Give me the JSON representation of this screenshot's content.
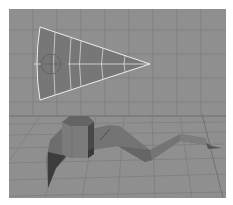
{
  "viewport": {
    "label": "3D perspective viewport",
    "background": "#8f8f8f",
    "grid_color": "#7d7d7d",
    "horizon_color": "#6f6f6f"
  },
  "objects": [
    {
      "name": "nurbs-wedge",
      "type": "selected surface",
      "wire_color": "#f2f2f2",
      "fill": "#757575"
    },
    {
      "name": "arm-mesh",
      "type": "polygon mesh",
      "fill": "#7a7a7a",
      "shadow": "#3e3e3e"
    }
  ]
}
